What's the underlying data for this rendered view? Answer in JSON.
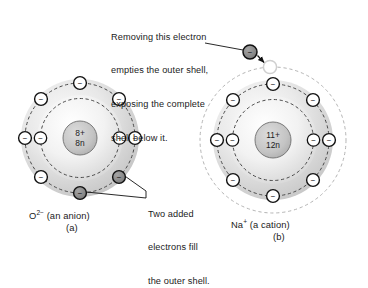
{
  "figure": {
    "background_color": "#ffffff",
    "callouts": [
      {
        "name": "removing-electron-callout",
        "lines": [
          "Removing this electron",
          "empties the outer shell,",
          "exposing the complete",
          "shell below it."
        ]
      },
      {
        "name": "two-added-electrons-callout",
        "lines": [
          "Two added",
          "electrons fill",
          "the outer shell."
        ]
      }
    ],
    "panels": [
      {
        "id": "a",
        "name": "oxide-anion-panel",
        "letter": "(a)",
        "species_symbol": "O",
        "species_charge": "2−",
        "species_note": "(an anion)",
        "species_full": "O2− (an anion)",
        "nucleus": {
          "protons": "8+",
          "neutrons": "8n"
        },
        "shells": [
          {
            "name": "inner-shell",
            "electron_count": 2
          },
          {
            "name": "outer-shell",
            "electron_count": 8,
            "highlighted_electrons": 2
          }
        ],
        "highlight_color": "#8c8c8c",
        "electron_glyph": "−"
      },
      {
        "id": "b",
        "name": "sodium-cation-panel",
        "letter": "(b)",
        "species_symbol": "Na",
        "species_charge": "+",
        "species_note": "(a cation)",
        "species_full": "Na+ (a cation)",
        "nucleus": {
          "protons": "11+",
          "neutrons": "12n"
        },
        "shells": [
          {
            "name": "inner-shell",
            "electron_count": 2
          },
          {
            "name": "middle-shell",
            "electron_count": 8
          },
          {
            "name": "emptied-outer-shell",
            "electron_count": 0,
            "vacancy_count": 1
          }
        ],
        "removed_electron": {
          "name": "removed-electron",
          "color": "#7d7d7d"
        },
        "electron_glyph": "−"
      }
    ],
    "colors": {
      "outline": "#111111",
      "electron_fill": "#ffffff",
      "electron_highlight": "#8c8c8c",
      "shell_dash": "#4a4a4a",
      "shell_dash_light": "#b4b4b4",
      "cloud_outer": "#c9c9c9",
      "cloud_inner": "#ededed",
      "nucleus_fill": "#c0c0c0",
      "leader_line": "#111111"
    }
  }
}
